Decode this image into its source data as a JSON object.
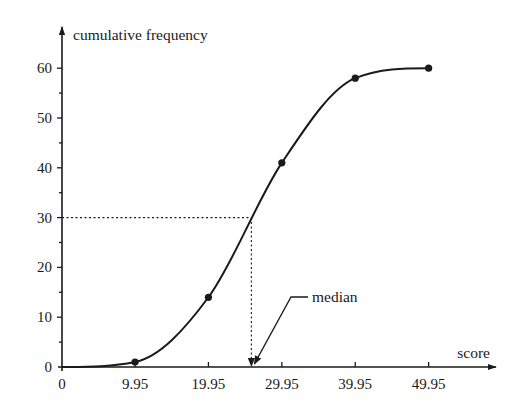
{
  "chart_data": {
    "type": "line",
    "title": "",
    "xlabel": "score",
    "ylabel": "cumulative frequency",
    "x_ticks": [
      0,
      9.95,
      19.95,
      29.95,
      39.95,
      49.95
    ],
    "x_tick_labels": [
      "0",
      "9.95",
      "19.95",
      "29.95",
      "39.95",
      "49.95"
    ],
    "y_ticks": [
      0,
      10,
      20,
      30,
      40,
      50,
      60
    ],
    "y_tick_labels": [
      "0",
      "10",
      "20",
      "30",
      "40",
      "50",
      "60"
    ],
    "y_minor_tick_step": 5,
    "xlim": [
      0,
      58
    ],
    "ylim": [
      0,
      68
    ],
    "grid": false,
    "series": [
      {
        "name": "cumulative frequency",
        "x": [
          0,
          9.95,
          19.95,
          29.95,
          39.95,
          49.95
        ],
        "y": [
          0,
          1,
          14,
          41,
          58,
          60
        ],
        "markers_at": [
          9.95,
          19.95,
          29.95,
          39.95,
          49.95
        ]
      }
    ],
    "annotations": [
      {
        "type": "median-guide",
        "label": "median",
        "y_value": 30,
        "x_value": 25.8
      }
    ]
  }
}
